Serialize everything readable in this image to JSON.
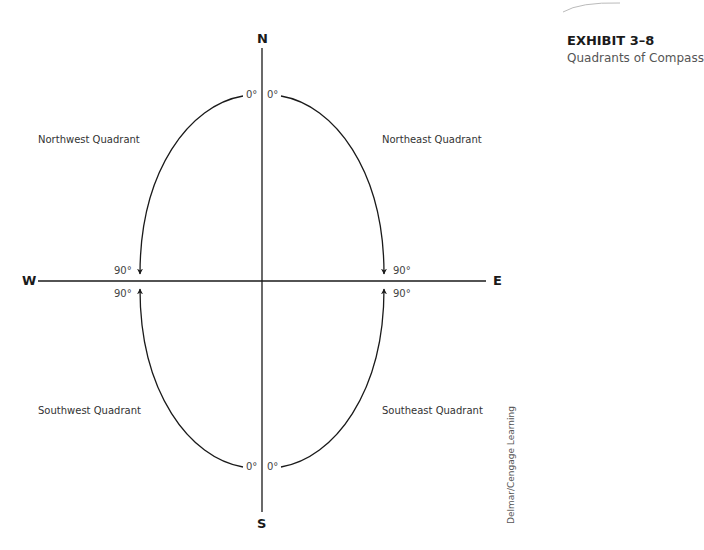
{
  "exhibit": {
    "title": "EXHIBIT 3–8",
    "subtitle": "Quadrants of Compass"
  },
  "cardinals": {
    "north": "N",
    "south": "S",
    "east": "E",
    "west": "W"
  },
  "quadrants": {
    "northwest": "Northwest  Quadrant",
    "northeast": "Northeast  Quadrant",
    "southwest": "Southwest Quadrant",
    "southeast": "Southeast Quadrant"
  },
  "degrees": {
    "nw_top": "0°",
    "ne_top": "0°",
    "nw_side": "90°",
    "ne_side": "90°",
    "sw_side": "90°",
    "se_side": "90°",
    "sw_bottom": "0°",
    "se_bottom": "0°"
  },
  "credit": "Delmar/Cengage Learning",
  "colors": {
    "line": "#1a1a1a",
    "text": "#333333",
    "background": "#ffffff"
  }
}
